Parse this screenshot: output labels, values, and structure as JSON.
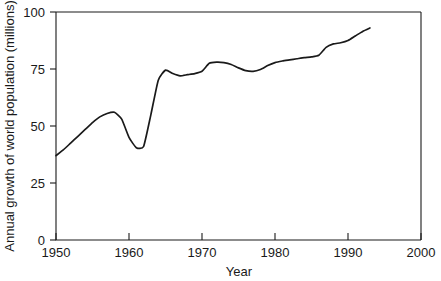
{
  "chart_data": {
    "type": "line",
    "title": "",
    "xlabel": "Year",
    "ylabel": "Annual growth of world population (millions)",
    "xlim": [
      1950,
      2000
    ],
    "ylim": [
      0,
      100
    ],
    "xticks": [
      1950,
      1960,
      1970,
      1980,
      1990,
      2000
    ],
    "xtick_labels": [
      "1950",
      "1960",
      "1970",
      "1980",
      "1990",
      "2000"
    ],
    "yticks": [
      0,
      25,
      50,
      75,
      100
    ],
    "ytick_labels": [
      "0",
      "25",
      "50",
      "75",
      "100"
    ],
    "grid": false,
    "legend": null,
    "line_color": "#1a1a1a",
    "series": [
      {
        "name": "Annual growth of world population",
        "x": [
          1950,
          1951,
          1952,
          1953,
          1954,
          1955,
          1956,
          1957,
          1958,
          1959,
          1960,
          1961,
          1962,
          1963,
          1964,
          1965,
          1966,
          1967,
          1968,
          1969,
          1970,
          1971,
          1972,
          1973,
          1974,
          1975,
          1976,
          1977,
          1978,
          1979,
          1980,
          1981,
          1982,
          1983,
          1984,
          1985,
          1986,
          1987,
          1988,
          1989,
          1990,
          1991,
          1992,
          1993
        ],
        "y": [
          37.0,
          39.5,
          42.5,
          45.5,
          48.5,
          51.5,
          54.0,
          55.5,
          56.0,
          53.0,
          45.0,
          40.5,
          41.0,
          55.0,
          70.0,
          74.5,
          73.0,
          72.0,
          72.5,
          73.0,
          74.0,
          77.5,
          78.0,
          77.8,
          77.0,
          75.5,
          74.3,
          74.0,
          74.8,
          76.5,
          77.8,
          78.5,
          79.0,
          79.5,
          80.0,
          80.3,
          81.0,
          84.5,
          86.0,
          86.5,
          87.5,
          89.5,
          91.5,
          93.0
        ]
      }
    ]
  },
  "axes": {
    "y_title": "Annual growth of world population (millions)",
    "x_title": "Year"
  }
}
